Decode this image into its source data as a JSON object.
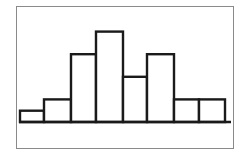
{
  "chart_data": {
    "type": "bar",
    "subtype": "histogram",
    "title": "",
    "xlabel": "",
    "ylabel": "",
    "categories": [
      "1",
      "2",
      "3",
      "4",
      "5",
      "6",
      "7",
      "8"
    ],
    "values": [
      1,
      2,
      6,
      8,
      4,
      6,
      2,
      2
    ],
    "ylim": [
      0,
      8
    ],
    "grid": false,
    "legend": null,
    "colors": {
      "bar_fill": "#ffffff",
      "bar_stroke": "#1a1a1a",
      "frame": "#8a8a8a"
    }
  }
}
